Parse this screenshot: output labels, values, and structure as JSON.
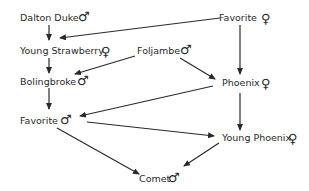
{
  "diagram": {
    "type": "pedigree",
    "nodes": [
      {
        "id": "dalton_duke",
        "label": "Dalton Duke",
        "sex": "male",
        "symbol": "♂"
      },
      {
        "id": "favorite_mare",
        "label": "Favorite",
        "sex": "female",
        "symbol": "♀"
      },
      {
        "id": "young_strawberry",
        "label": "Young Strawberry",
        "sex": "female",
        "symbol": "♀"
      },
      {
        "id": "foljambe",
        "label": "Foljambe",
        "sex": "male",
        "symbol": "♂"
      },
      {
        "id": "bolingbroke",
        "label": "Bolingbroke",
        "sex": "male",
        "symbol": "♂"
      },
      {
        "id": "phoenix",
        "label": "Phoenix",
        "sex": "female",
        "symbol": "♀"
      },
      {
        "id": "favorite_stallion",
        "label": "Favorite",
        "sex": "male",
        "symbol": "♂"
      },
      {
        "id": "young_phoenix",
        "label": "Young Phoenix",
        "sex": "female",
        "symbol": "♀"
      },
      {
        "id": "comet",
        "label": "Comet",
        "sex": "male",
        "symbol": "♂"
      }
    ],
    "edges": [
      {
        "from": "dalton_duke",
        "to": "young_strawberry"
      },
      {
        "from": "favorite_mare",
        "to": "young_strawberry"
      },
      {
        "from": "favorite_mare",
        "to": "phoenix"
      },
      {
        "from": "young_strawberry",
        "to": "bolingbroke"
      },
      {
        "from": "foljambe",
        "to": "bolingbroke"
      },
      {
        "from": "foljambe",
        "to": "phoenix"
      },
      {
        "from": "bolingbroke",
        "to": "favorite_stallion"
      },
      {
        "from": "phoenix",
        "to": "favorite_stallion"
      },
      {
        "from": "phoenix",
        "to": "young_phoenix"
      },
      {
        "from": "favorite_stallion",
        "to": "young_phoenix"
      },
      {
        "from": "favorite_stallion",
        "to": "comet"
      },
      {
        "from": "young_phoenix",
        "to": "comet"
      }
    ]
  }
}
